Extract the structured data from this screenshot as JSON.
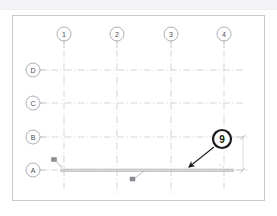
{
  "document": {
    "type": "cad-structural-grid-plan",
    "background_color": "#ffffff",
    "sheet_border_color": "#c9c9cc",
    "top_band_color": "#f4f4f6"
  },
  "grid": {
    "line_color": "#b8b8be",
    "line_style": "dash-dot",
    "column_label_title": "Column grid bubbles",
    "row_label_title": "Row grid bubbles",
    "columns": [
      {
        "label": "1",
        "x": 64
      },
      {
        "label": "2",
        "x": 117
      },
      {
        "label": "3",
        "x": 171
      },
      {
        "label": "4",
        "x": 224
      }
    ],
    "rows": [
      {
        "label": "D",
        "y": 70
      },
      {
        "label": "C",
        "y": 103
      },
      {
        "label": "B",
        "y": 137
      },
      {
        "label": "A",
        "y": 170
      }
    ],
    "bubble_fill": "#ffffff",
    "bubble_stroke": "#8c8c93",
    "bubble_radius": 7
  },
  "callout": {
    "label": "9",
    "cx": 222,
    "cy": 139,
    "radius": 9,
    "ring_color": "#1a1a1e",
    "fill_color": "#ffffff",
    "text_color": "#16161a",
    "leader": {
      "from_x": 214,
      "from_y": 147,
      "to_x": 187,
      "to_y": 169,
      "color": "#1a1a1e"
    }
  },
  "beam": {
    "name": "grid-a-beam",
    "x1": 60,
    "x2": 234,
    "y": 170,
    "color": "#a8a8ae",
    "thickness": 3
  },
  "dimension": {
    "name": "vertical-dimension-b-to-a",
    "x": 243,
    "y_top": 137,
    "y_bottom": 170,
    "text": "",
    "color": "#b0b0b6",
    "tick_color": "#9a9aa0"
  },
  "annotations": [
    {
      "name": "detail-marker-left",
      "x": 56,
      "y": 163,
      "label": ""
    },
    {
      "name": "detail-marker-bottom",
      "x": 132,
      "y": 180,
      "label": ""
    },
    {
      "name": "edge-tag-left",
      "x": 62,
      "y": 167,
      "label": ""
    },
    {
      "name": "edge-tag-right",
      "x": 221,
      "y": 167,
      "label": ""
    }
  ],
  "colors": {
    "grid_line": "#b8b8be",
    "callout_ring": "#1a1a1e",
    "beam": "#a8a8ae",
    "text": "#4a4a50"
  }
}
